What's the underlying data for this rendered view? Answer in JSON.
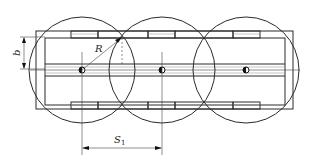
{
  "diagram": {
    "type": "technical-drawing",
    "labels": {
      "radius": "R",
      "width": "b",
      "spacing_main": "S",
      "spacing_sub": "1"
    },
    "circles": [
      {
        "cx": 82,
        "cy": 70,
        "r": 53
      },
      {
        "cx": 162,
        "cy": 70,
        "r": 53
      },
      {
        "cx": 246,
        "cy": 70,
        "r": 53
      }
    ],
    "colors": {
      "line": "#2a2a2a",
      "light_line": "#9a9a9a",
      "background": "#ffffff"
    }
  }
}
